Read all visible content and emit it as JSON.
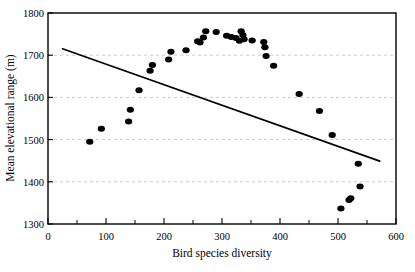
{
  "chart_data": {
    "type": "scatter",
    "title": "",
    "xlabel": "Bird species diversity",
    "ylabel": "Mean elevational range (m)",
    "xlim": [
      0,
      600
    ],
    "ylim": [
      1300,
      1800
    ],
    "xticks": [
      0,
      100,
      200,
      300,
      400,
      500,
      600
    ],
    "xtick_labels": [
      "0",
      "100",
      "200",
      "300",
      "400",
      "500",
      "600"
    ],
    "xminor_ticks": [
      50,
      150,
      250,
      350,
      450,
      550
    ],
    "yticks": [
      1300,
      1400,
      1500,
      1600,
      1700,
      1800
    ],
    "ytick_labels": [
      "1300",
      "1400",
      "1500",
      "1600",
      "1700",
      "1800"
    ],
    "grid": "horizontal-dashed",
    "grid_color": "#bdbdbd",
    "legend": "none",
    "marker": "filled-circle",
    "marker_color": "#000000",
    "marker_size": 6,
    "points": [
      {
        "x": 72,
        "y": 1495
      },
      {
        "x": 92,
        "y": 1526
      },
      {
        "x": 139,
        "y": 1543
      },
      {
        "x": 142,
        "y": 1571
      },
      {
        "x": 157,
        "y": 1617
      },
      {
        "x": 176,
        "y": 1663
      },
      {
        "x": 180,
        "y": 1677
      },
      {
        "x": 208,
        "y": 1690
      },
      {
        "x": 212,
        "y": 1708
      },
      {
        "x": 238,
        "y": 1712
      },
      {
        "x": 258,
        "y": 1733
      },
      {
        "x": 262,
        "y": 1730
      },
      {
        "x": 268,
        "y": 1742
      },
      {
        "x": 272,
        "y": 1757
      },
      {
        "x": 290,
        "y": 1755
      },
      {
        "x": 308,
        "y": 1746
      },
      {
        "x": 316,
        "y": 1743
      },
      {
        "x": 324,
        "y": 1741
      },
      {
        "x": 330,
        "y": 1734
      },
      {
        "x": 333,
        "y": 1757
      },
      {
        "x": 336,
        "y": 1748
      },
      {
        "x": 338,
        "y": 1738
      },
      {
        "x": 352,
        "y": 1735
      },
      {
        "x": 372,
        "y": 1731
      },
      {
        "x": 374,
        "y": 1719
      },
      {
        "x": 376,
        "y": 1698
      },
      {
        "x": 389,
        "y": 1675
      },
      {
        "x": 433,
        "y": 1608
      },
      {
        "x": 468,
        "y": 1568
      },
      {
        "x": 490,
        "y": 1511
      },
      {
        "x": 505,
        "y": 1337
      },
      {
        "x": 519,
        "y": 1357
      },
      {
        "x": 522,
        "y": 1361
      },
      {
        "x": 535,
        "y": 1443
      },
      {
        "x": 538,
        "y": 1389
      }
    ],
    "trend_line": {
      "name": "regression-line",
      "color": "#000000",
      "width": 1.6,
      "x_start": 25,
      "y_start": 1715,
      "x_end": 572,
      "y_end": 1449
    }
  }
}
